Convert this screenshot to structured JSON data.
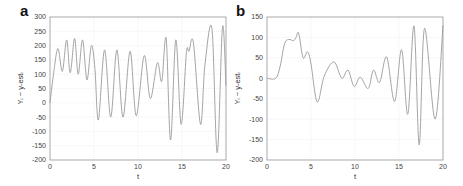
{
  "chart_data": [
    {
      "panel": "a",
      "type": "line",
      "title": "",
      "xlabel": "t",
      "ylabel": "Y_i − y-est_i",
      "xlim": [
        0,
        20
      ],
      "ylim": [
        -200,
        300
      ],
      "xticks": [
        0,
        5,
        10,
        15,
        20
      ],
      "yticks": [
        -200,
        -150,
        -100,
        -50,
        0,
        50,
        100,
        150,
        200,
        250,
        300
      ],
      "grid": true,
      "series": [
        {
          "name": "residual",
          "x": [
            0,
            0.4,
            0.9,
            1.4,
            1.9,
            2.3,
            2.8,
            3.2,
            3.7,
            4.2,
            4.7,
            5.1,
            5.5,
            6.2,
            6.9,
            7.6,
            8.3,
            9.1,
            9.8,
            10.7,
            11.4,
            12.2,
            12.7,
            13.2,
            13.7,
            14.3,
            14.9,
            15.5,
            15.8,
            16.3,
            17.1,
            17.6,
            18.4,
            19.0,
            19.6,
            20.0
          ],
          "y": [
            0,
            100,
            190,
            110,
            220,
            105,
            225,
            100,
            220,
            80,
            200,
            120,
            -60,
            185,
            -50,
            185,
            -50,
            180,
            -45,
            165,
            15,
            140,
            75,
            225,
            -130,
            220,
            -75,
            175,
            180,
            210,
            -75,
            130,
            260,
            -175,
            265,
            60
          ]
        }
      ]
    },
    {
      "panel": "b",
      "type": "line",
      "title": "",
      "xlabel": "t",
      "ylabel": "Y_i − y-est_i",
      "xlim": [
        0,
        20
      ],
      "ylim": [
        -200,
        150
      ],
      "xticks": [
        0,
        5,
        10,
        15,
        20
      ],
      "yticks": [
        -200,
        -150,
        -100,
        -50,
        0,
        50,
        100,
        150
      ],
      "grid": true,
      "series": [
        {
          "name": "residual",
          "x": [
            0,
            1.0,
            1.5,
            2.0,
            2.5,
            3.0,
            3.3,
            3.6,
            4.1,
            4.6,
            5.0,
            5.7,
            6.5,
            7.6,
            8.5,
            9.2,
            9.9,
            10.6,
            11.5,
            12.1,
            12.8,
            13.6,
            14.5,
            15.3,
            16.0,
            16.7,
            17.3,
            17.9,
            19.1,
            20.0
          ],
          "y": [
            0,
            0,
            30,
            85,
            95,
            92,
            100,
            110,
            50,
            65,
            35,
            -58,
            5,
            40,
            0,
            20,
            -20,
            3,
            -25,
            20,
            -10,
            52,
            -57,
            70,
            -88,
            128,
            -163,
            122,
            -100,
            130
          ]
        }
      ]
    }
  ],
  "panels": [
    {
      "label": "a",
      "xlabel": "t",
      "ylabel": "Yᵢ − y-estᵢ",
      "xticks": [
        "0",
        "5",
        "10",
        "15",
        "20"
      ],
      "yticks": [
        "300",
        "250",
        "200",
        "150",
        "100",
        "50",
        "0",
        "-50",
        "-100",
        "-150",
        "-200"
      ]
    },
    {
      "label": "b",
      "xlabel": "t",
      "ylabel": "Yᵢ − y-estᵢ",
      "xticks": [
        "0",
        "5",
        "10",
        "15",
        "20"
      ],
      "yticks": [
        "150",
        "100",
        "50",
        "0",
        "-50",
        "-100",
        "-150",
        "-200"
      ]
    }
  ],
  "colors": {
    "line": "#9a9a9a",
    "axis": "#999999",
    "grid": "#e6e6e6",
    "text": "#333333"
  }
}
